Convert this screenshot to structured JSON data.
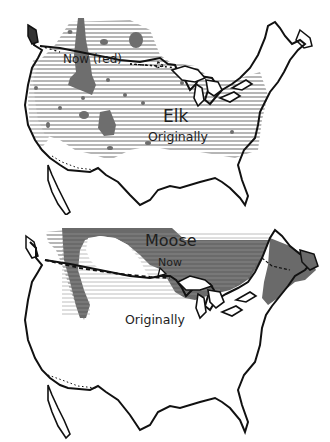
{
  "figure": {
    "type": "range-map-comparison",
    "colors": {
      "background": "#ffffff",
      "outline": "#111111",
      "original_range_hatch": "#8a8a8a",
      "current_range_fill": "#6e6e6e"
    },
    "panels": [
      {
        "id": "elk",
        "title": "Elk",
        "labels": {
          "species": "Elk",
          "now": "Now (red)",
          "original": "Originally"
        }
      },
      {
        "id": "moose",
        "title": "Moose",
        "labels": {
          "species": "Moose",
          "now": "Now",
          "original": "Originally"
        }
      }
    ]
  }
}
